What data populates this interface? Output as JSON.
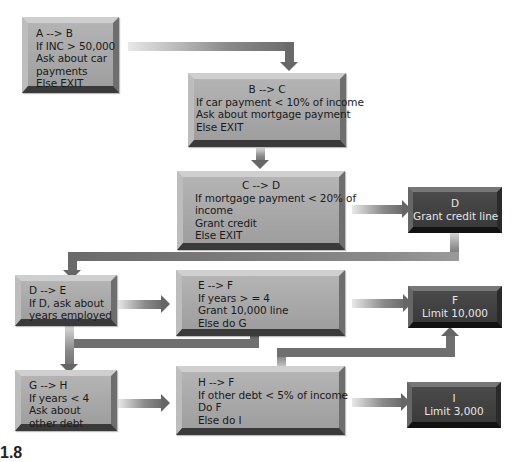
{
  "diagram": {
    "nodes": [
      {
        "id": "A",
        "title": "A --> B",
        "lines": [
          "If INC > 50,000",
          "Ask about car",
          "payments",
          "Else EXIT"
        ],
        "style": "light"
      },
      {
        "id": "B",
        "title": "B --> C",
        "lines": [
          "If car payment < 10% of income",
          "Ask about mortgage payment",
          "Else EXIT"
        ],
        "style": "light"
      },
      {
        "id": "C",
        "title": "C --> D",
        "lines": [
          "If mortgage payment < 20% of",
          "income",
          "Grant credit",
          "Else EXIT"
        ],
        "style": "light"
      },
      {
        "id": "D",
        "title": "D",
        "lines": [
          "Grant credit line"
        ],
        "style": "dark"
      },
      {
        "id": "E_from_D",
        "title": "D --> E",
        "lines": [
          "If D, ask about",
          "years employed"
        ],
        "style": "light"
      },
      {
        "id": "E",
        "title": "E --> F",
        "lines": [
          "If years > =  4",
          "Grant 10,000 line",
          "Else do G"
        ],
        "style": "light"
      },
      {
        "id": "F",
        "title": "F",
        "lines": [
          "Limit 10,000"
        ],
        "style": "dark"
      },
      {
        "id": "G",
        "title": "G --> H",
        "lines": [
          "If years < 4",
          "Ask about",
          "other debt"
        ],
        "style": "light"
      },
      {
        "id": "H",
        "title": "H --> F",
        "lines": [
          "If other debt < 5% of income",
          "Do F",
          "Else do I"
        ],
        "style": "light"
      },
      {
        "id": "I",
        "title": "I",
        "lines": [
          "Limit 3,000"
        ],
        "style": "dark"
      }
    ],
    "edges": [
      {
        "from": "A",
        "to": "B"
      },
      {
        "from": "B",
        "to": "C"
      },
      {
        "from": "C",
        "to": "D"
      },
      {
        "from": "D",
        "to": "E_from_D"
      },
      {
        "from": "E_from_D",
        "to": "E"
      },
      {
        "from": "E",
        "to": "F"
      },
      {
        "from": "E",
        "to": "G"
      },
      {
        "from": "G",
        "to": "H"
      },
      {
        "from": "H",
        "to": "F"
      },
      {
        "from": "H",
        "to": "I"
      }
    ],
    "figure_label": "1.8"
  }
}
